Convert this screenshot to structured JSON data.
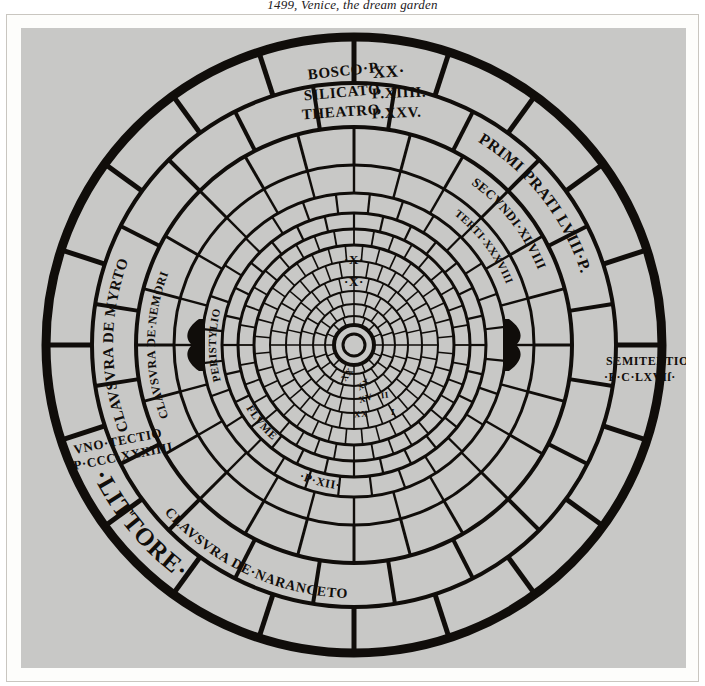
{
  "caption": "1499, Venice, the dream garden",
  "plate": {
    "background_color": "#c8c8c6",
    "ink_color": "#100d0a",
    "paper_color": "#fdfdfb"
  },
  "diagram": {
    "type": "concentric-circular-garden-plan",
    "center": {
      "x": 333,
      "y": 317
    },
    "rings": [
      {
        "name": "outer-boundary",
        "r": 308,
        "stroke": 9
      },
      {
        "name": "ring-2",
        "r": 262,
        "stroke": 4
      },
      {
        "name": "ring-3",
        "r": 218,
        "stroke": 4
      },
      {
        "name": "ring-4",
        "r": 180,
        "stroke": 3
      },
      {
        "name": "ring-5",
        "r": 152,
        "stroke": 3
      },
      {
        "name": "ring-6",
        "r": 132,
        "stroke": 3
      },
      {
        "name": "ring-7",
        "r": 116,
        "stroke": 3
      },
      {
        "name": "ring-8",
        "r": 100,
        "stroke": 3
      },
      {
        "name": "ring-9",
        "r": 84,
        "stroke": 2
      },
      {
        "name": "ring-10",
        "r": 68,
        "stroke": 2
      },
      {
        "name": "ring-11",
        "r": 54,
        "stroke": 2
      },
      {
        "name": "ring-12",
        "r": 41,
        "stroke": 2
      },
      {
        "name": "ring-13",
        "r": 29,
        "stroke": 2
      },
      {
        "name": "hub-outer",
        "r": 20,
        "stroke": 4
      },
      {
        "name": "hub-inner",
        "r": 11,
        "stroke": 3
      }
    ],
    "spokes_outer": 20,
    "spokes_mid": 28,
    "spokes_inner": 36,
    "gate_markers": [
      {
        "name": "gate-west",
        "angle_deg": 180
      },
      {
        "name": "gate-east",
        "angle_deg": 0
      }
    ],
    "labels": [
      {
        "name": "label-bosco",
        "text": "BOSCO·P.",
        "kind": "straight"
      },
      {
        "name": "label-bosco-value",
        "text": "XX·",
        "kind": "straight"
      },
      {
        "name": "label-silicato",
        "text": "SILICATO",
        "kind": "straight"
      },
      {
        "name": "label-silicato-value",
        "text": "P.XIIII.",
        "kind": "straight"
      },
      {
        "name": "label-theatro",
        "text": "THEATRO",
        "kind": "straight"
      },
      {
        "name": "label-theatro-value",
        "text": "P.XXV.",
        "kind": "straight"
      },
      {
        "name": "label-primi-prati",
        "text": "PRIMI PRATI LVIII·P.",
        "kind": "arc"
      },
      {
        "name": "label-secvndi",
        "text": "SECVNDI·XLVIII",
        "kind": "arc"
      },
      {
        "name": "label-terti",
        "text": "TERTI·XXXVIII",
        "kind": "arc"
      },
      {
        "name": "label-semitertio",
        "text": "SEMITERTIO",
        "kind": "straight"
      },
      {
        "name": "label-semitertio-value",
        "text": "·P·C·LXVIſ·",
        "kind": "straight"
      },
      {
        "name": "label-clavsvra-myrto",
        "text": "CLAVSVRA DE MYRTO",
        "kind": "arc"
      },
      {
        "name": "label-clavsvra-nemori",
        "text": "CLAVSVRA DE·NEMORI",
        "kind": "arc"
      },
      {
        "name": "label-vno-tectio",
        "text": "VNO·TECTIO",
        "kind": "straight"
      },
      {
        "name": "label-vno-tectio-value",
        "text": "·P·CCC·XXXIIII",
        "kind": "straight"
      },
      {
        "name": "label-clavsvra-naranceto",
        "text": "CLAVSVRA DE·NARANCETO",
        "kind": "arc"
      },
      {
        "name": "label-littore",
        "text": "·LITTORE·",
        "kind": "arc"
      },
      {
        "name": "label-peristylio",
        "text": "PERISTYLIO",
        "kind": "arc"
      },
      {
        "name": "label-x-outer",
        "text": "·X·",
        "kind": "straight"
      },
      {
        "name": "label-x-inner",
        "text": "·X·",
        "kind": "straight"
      },
      {
        "name": "label-flvme",
        "text": "FLVME",
        "kind": "arc"
      },
      {
        "name": "label-p-xii",
        "text": "·P·XII·",
        "kind": "arc"
      },
      {
        "name": "label-inner-xx-a",
        "text": "XX",
        "kind": "straight"
      },
      {
        "name": "label-inner-xx-b",
        "text": "XX",
        "kind": "straight"
      },
      {
        "name": "label-inner-xx-c",
        "text": "XX",
        "kind": "straight"
      },
      {
        "name": "label-inner-xv",
        "text": "XV",
        "kind": "straight"
      },
      {
        "name": "label-inner-ii",
        "text": "II",
        "kind": "straight"
      },
      {
        "name": "label-inner-i",
        "text": "I",
        "kind": "straight"
      }
    ]
  }
}
